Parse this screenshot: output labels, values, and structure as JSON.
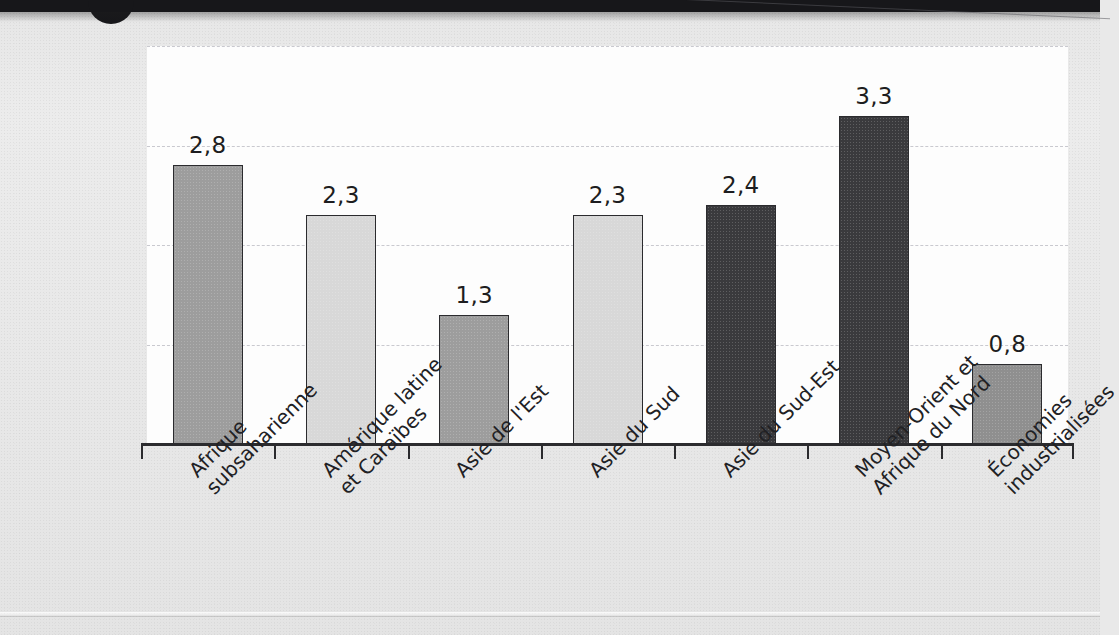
{
  "document": {
    "kind": "scanned-report-page",
    "artifacts": [
      "top-dark-band",
      "circular-punch-mark",
      "diagonal-scan-crease",
      "bottom-rule"
    ]
  },
  "chart_data": {
    "type": "bar",
    "title": "",
    "subtitle": "",
    "xlabel": "",
    "ylabel": "",
    "ylim": [
      0,
      4.0
    ],
    "grid": true,
    "gridlines": [
      1.0,
      2.0,
      3.0,
      4.0
    ],
    "legend": "none",
    "decimal_separator": ",",
    "categories": [
      "Afrique subsaharienne",
      "Amérique latine et Caraïbes",
      "Asie de l'Est",
      "Asie du Sud",
      "Asie du Sud-Est",
      "Moyen-Orient et Afrique du Nord",
      "Économies industrialisées"
    ],
    "category_lines": [
      [
        "Afrique",
        "subsaharienne"
      ],
      [
        "Amérique latine",
        "et Caraïbes"
      ],
      [
        "Asie de l'Est",
        ""
      ],
      [
        "Asie du Sud",
        ""
      ],
      [
        "Asie du Sud-Est",
        ""
      ],
      [
        "Moyen-Orient et",
        "Afrique du Nord"
      ],
      [
        "Économies",
        "industrialisées"
      ]
    ],
    "values": [
      2.8,
      2.3,
      1.3,
      2.3,
      2.4,
      3.3,
      0.8
    ],
    "value_labels": [
      "2,8",
      "2,3",
      "1,3",
      "2,3",
      "2,4",
      "3,3",
      "0,8"
    ],
    "bar_colors": [
      "#9d9d9d",
      "#d8d8d8",
      "#9d9d9d",
      "#d8d8d8",
      "#3a3a3d",
      "#3a3a3d",
      "#8f8f8f"
    ],
    "bar_color_names": [
      "medium-grey",
      "light-grey",
      "medium-grey",
      "light-grey",
      "dark-grey",
      "dark-grey",
      "medium-grey"
    ]
  },
  "style": {
    "panel_background": "#fdfdfd",
    "page_background": "#e8e8e8",
    "axis_color": "#2b2b2e",
    "gridline_color": "#c9c9cf",
    "text_color": "#1d1d20",
    "band_color": "#17171a"
  }
}
